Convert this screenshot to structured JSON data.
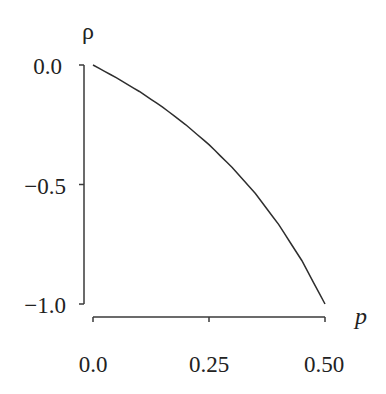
{
  "chart_data": {
    "type": "line",
    "title": "",
    "xlabel": "p",
    "ylabel": "ρ",
    "xlim": [
      0.0,
      0.5
    ],
    "ylim": [
      -1.0,
      0.0
    ],
    "grid": false,
    "legend": null,
    "x_ticks": [
      "0.0",
      "0.25",
      "0.50"
    ],
    "y_ticks": [
      "0.0",
      "−0.5",
      "−1.0"
    ],
    "series": [
      {
        "name": "ρ = −p/(1−p)",
        "x": [
          0.0,
          0.05,
          0.1,
          0.15,
          0.2,
          0.25,
          0.3,
          0.35,
          0.4,
          0.45,
          0.5
        ],
        "y": [
          0.0,
          -0.053,
          -0.111,
          -0.176,
          -0.25,
          -0.333,
          -0.429,
          -0.538,
          -0.667,
          -0.818,
          -1.0
        ]
      }
    ]
  },
  "labels": {
    "y_axis_title": "ρ",
    "x_axis_title": "p",
    "y_tick_0": "0.0",
    "y_tick_1": "−0.5",
    "y_tick_2": "−1.0",
    "x_tick_0": "0.0",
    "x_tick_1": "0.25",
    "x_tick_2": "0.50"
  },
  "colors": {
    "line": "#2e2e2e",
    "axis": "#3a3a3a",
    "background": "#ffffff"
  }
}
